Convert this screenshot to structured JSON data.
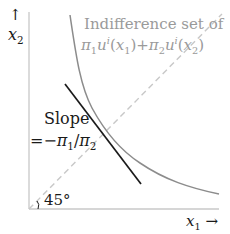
{
  "diagram": {
    "colors": {
      "axis": "#c8c8c8",
      "curve": "#8c8c8c",
      "tangent": "#1a1a1a",
      "diagonal": "#c8c8c8",
      "label_gray": "#9a9a9a",
      "label_dark": "#1a1a1a"
    },
    "axes": {
      "y_arrow": "↑",
      "y_label_var": "x",
      "y_label_sub": "2",
      "x_label_var": "x",
      "x_label_sub": "1",
      "x_arrow": "→"
    },
    "curve_label": {
      "line1": "Indifference set of",
      "pi1": "π",
      "pi1_sub": "1",
      "u1": "u",
      "u1_sup": "i",
      "arg1_open": "(",
      "arg1_var": "x",
      "arg1_sub": "1",
      "arg1_close": ")",
      "plus": "+",
      "pi2": "π",
      "pi2_sub": "2",
      "u2": "u",
      "u2_sup": "i",
      "arg2_open": "(",
      "arg2_var": "x",
      "arg2_sub": "2",
      "arg2_close": ")"
    },
    "slope_label": {
      "line1": "Slope",
      "eq": "=",
      "minus": "−",
      "pi1": "π",
      "pi1_sub": "1",
      "slash": "/",
      "pi2": "π",
      "pi2_sub": "2"
    },
    "angle_label": "45°"
  }
}
